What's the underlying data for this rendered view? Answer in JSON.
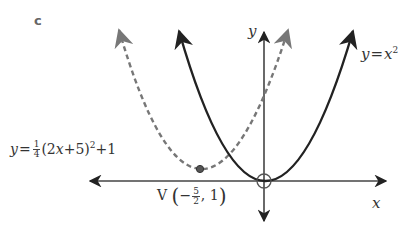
{
  "part_label": "c",
  "axes": {
    "x_label": "x",
    "y_label": "y",
    "origin_marker": "circle"
  },
  "curves": [
    {
      "name": "base-parabola",
      "equation_lhs": "y",
      "equation_eq": "=",
      "equation_var": "x",
      "equation_exp": "2",
      "style": "solid",
      "color": "#222222",
      "vertex": [
        0,
        0
      ]
    },
    {
      "name": "transformed-parabola",
      "equation_lhs": "y",
      "equation_eq": "=",
      "coef_num": "1",
      "coef_den": "4",
      "inner_open": "(2",
      "inner_var": "x",
      "inner_rest": "+5)",
      "exp": "2",
      "tail": "+1",
      "style": "dashed",
      "color": "#777777",
      "vertex": [
        -2.5,
        1
      ]
    }
  ],
  "vertex_label": {
    "prefix": "V",
    "minus": "−",
    "num": "5",
    "den": "2",
    "sep": ",",
    "y_value": "1",
    "open": "(",
    "close": ")"
  }
}
